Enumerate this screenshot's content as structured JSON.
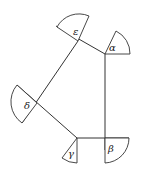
{
  "diagram": {
    "type": "pentagon-angle-diagram",
    "vertices": [
      {
        "id": "epsilon",
        "label": "ε",
        "x": 78,
        "y": 41
      },
      {
        "id": "alpha",
        "label": "α",
        "x": 105,
        "y": 54
      },
      {
        "id": "beta",
        "label": "β",
        "x": 105,
        "y": 138
      },
      {
        "id": "gamma",
        "label": "γ",
        "x": 77,
        "y": 138
      },
      {
        "id": "delta",
        "label": "δ",
        "x": 37,
        "y": 103
      }
    ],
    "edges": [
      {
        "from": "epsilon",
        "to": "alpha"
      },
      {
        "from": "alpha",
        "to": "beta"
      },
      {
        "from": "beta",
        "to": "gamma"
      },
      {
        "from": "gamma",
        "to": "delta"
      },
      {
        "from": "delta",
        "to": "epsilon"
      }
    ],
    "labels": {
      "epsilon": "ε",
      "alpha": "α",
      "beta": "β",
      "gamma": "γ",
      "delta": "δ"
    }
  }
}
